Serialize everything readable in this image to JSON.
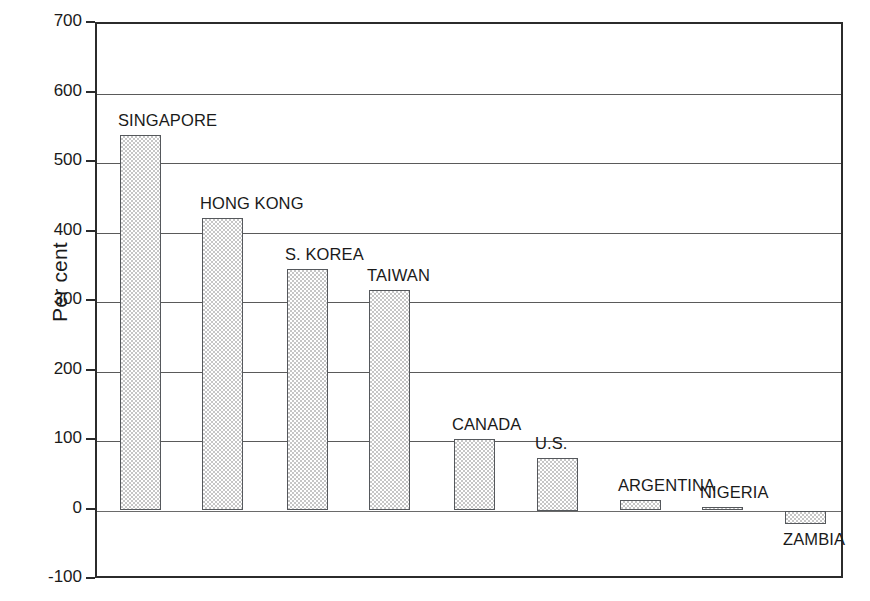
{
  "chart_data": {
    "type": "bar",
    "title": "",
    "subtitle": "",
    "xlabel": "",
    "ylabel": "Per cent",
    "ylim": [
      -100,
      700
    ],
    "yticks": [
      -100,
      0,
      100,
      200,
      300,
      400,
      500,
      600,
      700
    ],
    "ytick_labels": [
      "-100",
      "0",
      "100",
      "200",
      "300",
      "400",
      "500",
      "600",
      "700"
    ],
    "grid": true,
    "legend": false,
    "legend_position": "none",
    "categories": [
      "SINGAPORE",
      "HONG KONG",
      "S. KOREA",
      "TAIWAN",
      "CANADA",
      "U.S.",
      "ARGENTINA",
      "NIGERIA",
      "ZAMBIA"
    ],
    "values": [
      540,
      421,
      347,
      317,
      103,
      75,
      15,
      5,
      -20
    ],
    "bar_fill": "checker-gray",
    "bar_border_color": "#55585c",
    "axis_color": "#2b2b2b",
    "gridline_color": "#5a5a5a",
    "background_color": "#ffffff"
  },
  "axis": {
    "y_title": "Per cent"
  },
  "bars": [
    {
      "label": "SINGAPORE",
      "value": 540,
      "label_position": "above"
    },
    {
      "label": "HONG KONG",
      "value": 421,
      "label_position": "above"
    },
    {
      "label": "S. KOREA",
      "value": 347,
      "label_position": "above"
    },
    {
      "label": "TAIWAN",
      "value": 317,
      "label_position": "above"
    },
    {
      "label": "CANADA",
      "value": 103,
      "label_position": "above"
    },
    {
      "label": "U.S.",
      "value": 75,
      "label_position": "above"
    },
    {
      "label": "ARGENTINA",
      "value": 15,
      "label_position": "above"
    },
    {
      "label": "NIGERIA",
      "value": 5,
      "label_position": "above"
    },
    {
      "label": "ZAMBIA",
      "value": -20,
      "label_position": "below"
    }
  ],
  "ticks": [
    {
      "value": 700,
      "label": "700"
    },
    {
      "value": 600,
      "label": "600"
    },
    {
      "value": 500,
      "label": "500"
    },
    {
      "value": 400,
      "label": "400"
    },
    {
      "value": 300,
      "label": "300"
    },
    {
      "value": 200,
      "label": "200"
    },
    {
      "value": 100,
      "label": "100"
    },
    {
      "value": 0,
      "label": "0"
    },
    {
      "value": -100,
      "label": "-100"
    }
  ]
}
